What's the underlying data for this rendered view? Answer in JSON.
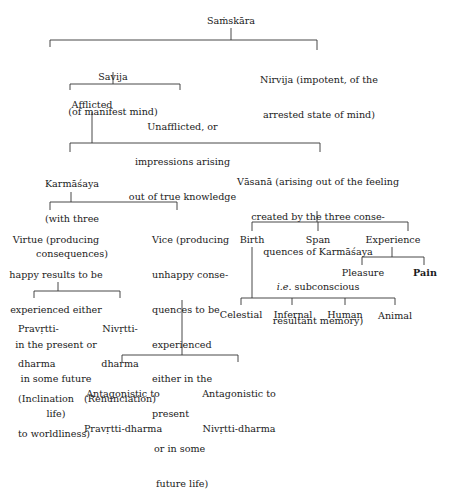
{
  "diagram": {
    "root": {
      "label": "Saṁskāra"
    },
    "savija": {
      "lines": [
        "Savija",
        "(of manifest mind)"
      ]
    },
    "nirvija": {
      "lines": [
        "Nirvija (impotent, of the",
        "arrested state of mind)"
      ]
    },
    "afflicted": {
      "label": "Afflicted"
    },
    "unafflicted": {
      "lines": [
        "Unafflicted, or",
        "impressions arising",
        "out of true knowledge"
      ]
    },
    "karmasaya": {
      "lines": [
        "Karmāśaya",
        "(with three",
        "consequences)"
      ]
    },
    "vasana": {
      "lines": [
        "Vāsanā (arising out of the feeling",
        "created by the three conse-",
        "quences of Karmāśaya",
        "subconscious",
        "resultant memory)"
      ],
      "ie": "i.e."
    },
    "virtue": {
      "lines": [
        "Virtue (producing",
        "happy results to be",
        "experienced either",
        "in the present or",
        "in some future",
        "life)"
      ]
    },
    "vice": {
      "lines": [
        "Vice (producing",
        "unhappy conse-",
        "quences to be",
        "experienced",
        "either in the",
        "present",
        "or in some",
        "future life)"
      ]
    },
    "birth": {
      "label": "Birth"
    },
    "span": {
      "label": "Span"
    },
    "experience": {
      "label": "Experience"
    },
    "pleasure": {
      "label": "Pleasure"
    },
    "pain": {
      "label": "Pain"
    },
    "pravrtti": {
      "lines": [
        "Pravṛtti-",
        "dharma",
        "(Inclination",
        "to worldliness)"
      ]
    },
    "nivrtti": {
      "lines": [
        "Nivṛtti-",
        "dharma",
        "(Renunciation)"
      ]
    },
    "celestial": {
      "label": "Celestial"
    },
    "infernal": {
      "label": "Infernal"
    },
    "human": {
      "label": "Human"
    },
    "animal": {
      "label": "Animal"
    },
    "antag_pravrtti": {
      "lines": [
        "Antagonistic to",
        "Pravṛtti-dharma"
      ]
    },
    "antag_nivrtti": {
      "lines": [
        "Antagonistic to",
        "Nivṛtti-dharma"
      ]
    }
  }
}
